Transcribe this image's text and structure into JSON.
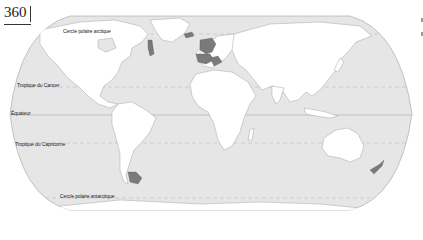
{
  "page": {
    "number": "360"
  },
  "map": {
    "projection": "robinson-like world map",
    "colors": {
      "ocean": "#e6e6e6",
      "land": "#ffffff",
      "highlight": "#7a7a7a",
      "outline": "#b0b0b0",
      "latitude_line": "#bdbdbd"
    },
    "latitude_labels": {
      "arctic": "Cercle polaire arctique",
      "cancer": "Tropique du Cancer",
      "equator": "Équateur",
      "capricorn": "Tropique du Capricorne",
      "antarctic": "Cercle polaire antarctique"
    },
    "highlighted_regions": [
      "Scotland / British Isles",
      "Brittany",
      "Galicia",
      "Nova Scotia",
      "Patagonia",
      "New Zealand"
    ]
  }
}
